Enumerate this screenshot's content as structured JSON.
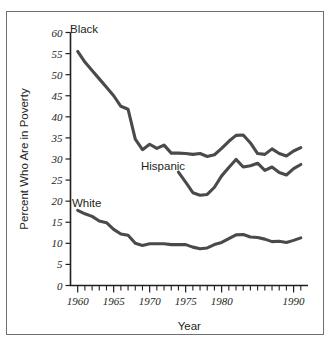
{
  "chart_data": {
    "type": "line",
    "title": "",
    "xlabel": "Year",
    "ylabel": "Percent Who Are in Poverty",
    "xlim": [
      1959,
      1992
    ],
    "ylim": [
      0,
      60
    ],
    "grid": false,
    "legend_position": "inline-labels",
    "y_ticks": [
      0,
      5,
      10,
      15,
      20,
      25,
      30,
      35,
      40,
      45,
      50,
      55,
      60
    ],
    "y_tick_labels": [
      "0",
      "5",
      "10",
      "15",
      "20",
      "25",
      "30",
      "35",
      "40",
      "45",
      "50",
      "55",
      "60"
    ],
    "x_ticks": [
      1960,
      1961,
      1962,
      1963,
      1964,
      1965,
      1966,
      1967,
      1968,
      1969,
      1970,
      1971,
      1972,
      1973,
      1974,
      1975,
      1976,
      1977,
      1978,
      1979,
      1980,
      1981,
      1982,
      1983,
      1984,
      1985,
      1986,
      1987,
      1988,
      1989,
      1990,
      1991
    ],
    "x_tick_labels": [
      {
        "value": 1960,
        "label": "1960"
      },
      {
        "value": 1965,
        "label": "1965"
      },
      {
        "value": 1970,
        "label": "1970"
      },
      {
        "value": 1975,
        "label": "1975"
      },
      {
        "value": 1980,
        "label": "1980"
      },
      {
        "value": 1990,
        "label": "1990"
      }
    ],
    "series": [
      {
        "name": "Black",
        "label": "Black",
        "color": "#4a4a4a",
        "x": [
          1960,
          1961,
          1962,
          1963,
          1964,
          1965,
          1966,
          1967,
          1968,
          1969,
          1970,
          1971,
          1972,
          1973,
          1974,
          1975,
          1976,
          1977,
          1978,
          1979,
          1980,
          1981,
          1982,
          1983,
          1984,
          1985,
          1986,
          1987,
          1988,
          1989,
          1990,
          1991
        ],
        "values": [
          55.5,
          53.0,
          51.0,
          49.0,
          47.0,
          45.0,
          42.5,
          41.8,
          34.7,
          32.2,
          33.5,
          32.5,
          33.3,
          31.4,
          31.4,
          31.3,
          31.1,
          31.3,
          30.6,
          31.0,
          32.5,
          34.2,
          35.6,
          35.7,
          33.8,
          31.3,
          31.1,
          32.4,
          31.3,
          30.7,
          31.9,
          32.7
        ]
      },
      {
        "name": "Hispanic",
        "label": "Hispanic",
        "color": "#4a4a4a",
        "x": [
          1974,
          1975,
          1976,
          1977,
          1978,
          1979,
          1980,
          1981,
          1982,
          1983,
          1984,
          1985,
          1986,
          1987,
          1988,
          1989,
          1990,
          1991
        ],
        "values": [
          26.9,
          24.5,
          22.0,
          21.4,
          21.6,
          23.3,
          26.0,
          28.0,
          29.9,
          28.1,
          28.4,
          29.0,
          27.3,
          28.1,
          26.8,
          26.2,
          27.7,
          28.7
        ]
      },
      {
        "name": "White",
        "label": "White",
        "color": "#6d6d6d",
        "x": [
          1960,
          1961,
          1962,
          1963,
          1964,
          1965,
          1966,
          1967,
          1968,
          1969,
          1970,
          1971,
          1972,
          1973,
          1974,
          1975,
          1976,
          1977,
          1978,
          1979,
          1980,
          1981,
          1982,
          1983,
          1984,
          1985,
          1986,
          1987,
          1988,
          1989,
          1990,
          1991
        ],
        "values": [
          17.8,
          17.0,
          16.4,
          15.3,
          14.9,
          13.3,
          12.2,
          11.9,
          10.0,
          9.5,
          9.9,
          9.9,
          9.9,
          9.7,
          9.7,
          9.7,
          9.1,
          8.7,
          8.9,
          9.7,
          10.2,
          11.1,
          12.0,
          12.1,
          11.5,
          11.4,
          11.0,
          10.4,
          10.5,
          10.2,
          10.7,
          11.3
        ]
      }
    ],
    "annotations": [
      {
        "text": "Black",
        "series": "Black",
        "x_px": 70,
        "y_px": 33
      },
      {
        "text": "Hispanic",
        "series": "Hispanic",
        "x_px": 141,
        "y_px": 170
      },
      {
        "text": "White",
        "series": "White",
        "x_px": 72,
        "y_px": 207
      }
    ]
  }
}
